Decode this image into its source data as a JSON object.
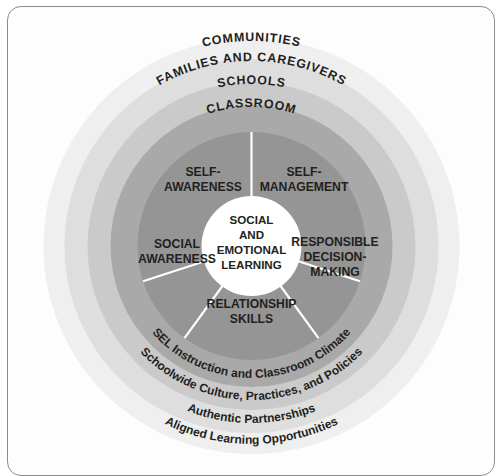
{
  "diagram": {
    "core": {
      "name": "social-and-emotional-learning-core",
      "lines": [
        "SOCIAL",
        "AND",
        "EMOTIONAL",
        "LEARNING"
      ],
      "color": "#ffffff"
    },
    "competencies": [
      {
        "id": "self-awareness",
        "lines": [
          "SELF-",
          "AWARENESS"
        ]
      },
      {
        "id": "self-management",
        "lines": [
          "SELF-",
          "MANAGEMENT"
        ]
      },
      {
        "id": "responsible-decision-making",
        "lines": [
          "RESPONSIBLE",
          "DECISION-",
          "MAKING"
        ]
      },
      {
        "id": "relationship-skills",
        "lines": [
          "RELATIONSHIP",
          "SKILLS"
        ]
      },
      {
        "id": "social-awareness",
        "lines": [
          "SOCIAL",
          "AWARENESS"
        ]
      }
    ],
    "rings": [
      {
        "id": "classroom",
        "top_label": "CLASSROOM",
        "bottom_label": "SEL Instruction and Classroom Climate",
        "color": "#a8a8a8"
      },
      {
        "id": "schools",
        "top_label": "SCHOOLS",
        "bottom_label": "Schoolwide Culture, Practices, and Policies",
        "color": "#c9c9c9"
      },
      {
        "id": "families-and-caregivers",
        "top_label": "FAMILIES AND CAREGIVERS",
        "bottom_label": "Authentic Partnerships",
        "color": "#dcdcdc"
      },
      {
        "id": "communities",
        "top_label": "COMMUNITIES",
        "bottom_label": "Aligned Learning Opportunities",
        "color": "#eeeeee"
      }
    ],
    "competency_ring_color": "#949494",
    "text_color": "#231f20",
    "divider_color": "#ffffff",
    "frame_color": "#8b8b8b"
  }
}
